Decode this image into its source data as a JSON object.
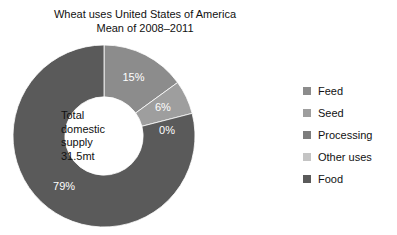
{
  "chart_data": {
    "type": "pie",
    "variant": "donut",
    "title": "Wheat uses United States of America",
    "subtitle": "Mean of 2008–2011",
    "title_lines": [
      "Wheat uses United States of America",
      "Mean of 2008–2011"
    ],
    "categories": [
      "Feed",
      "Seed",
      "Processing",
      "Other uses",
      "Food"
    ],
    "values": [
      15,
      6,
      0,
      0,
      79
    ],
    "value_labels": [
      "15%",
      "6%",
      "0%",
      "",
      "79%"
    ],
    "colors": [
      "#8c8c8c",
      "#9e9e9e",
      "#7d7d7d",
      "#c4c4c4",
      "#5a5a5a"
    ],
    "units": "percent",
    "start_angle_deg": 0,
    "direction": "clockwise",
    "inner_radius_ratio": 0.43,
    "legend_position": "right",
    "grid": false,
    "xlabel": "",
    "ylabel": "",
    "center_annotation": {
      "lines": [
        "Total",
        "domestic",
        "supply",
        "31.5mt"
      ],
      "total_label": "Total domestic supply",
      "total_value": "31.5mt"
    }
  },
  "legend": {
    "items": [
      {
        "label": "Feed",
        "color": "#8c8c8c"
      },
      {
        "label": "Seed",
        "color": "#9e9e9e"
      },
      {
        "label": "Processing",
        "color": "#7d7d7d"
      },
      {
        "label": "Other uses",
        "color": "#c4c4c4"
      },
      {
        "label": "Food",
        "color": "#5a5a5a"
      }
    ]
  }
}
